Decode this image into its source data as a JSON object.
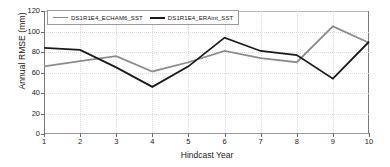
{
  "chart_data": {
    "type": "line",
    "title": "",
    "xlabel": "Hindcast Year",
    "ylabel": "Annual RMSE (mm)",
    "x": [
      1,
      2,
      3,
      4,
      5,
      6,
      7,
      8,
      9,
      10
    ],
    "xticklabels": [
      "1",
      "2",
      "3",
      "4",
      "5",
      "6",
      "7",
      "8",
      "9",
      "10"
    ],
    "yticklabels": [
      "0",
      "20",
      "40",
      "60",
      "80",
      "100",
      "120"
    ],
    "yticks": [
      0,
      20,
      40,
      60,
      80,
      100,
      120
    ],
    "xlim": [
      1,
      10
    ],
    "ylim": [
      0,
      120
    ],
    "grid": true,
    "grid_style": "dotted",
    "legend_position": "top-inside-left",
    "series": [
      {
        "name": "DS1R1E4_ECHAM6_SST",
        "color": "#8c8c8c",
        "width": 1.8,
        "values": [
          66,
          71,
          76,
          61,
          70,
          81,
          74,
          70,
          105,
          89
        ]
      },
      {
        "name": "DS1R1E4_ERAint_SST",
        "color": "#1a1a1a",
        "width": 1.8,
        "values": [
          84,
          82,
          65,
          46,
          66,
          94,
          81,
          77,
          54,
          90
        ]
      }
    ]
  },
  "axes": {
    "frame_color": "#7a7a7a",
    "grid_color": "#d9d9d9",
    "tick_color": "#6a6a6a",
    "text_color": "#1a1a1a"
  }
}
